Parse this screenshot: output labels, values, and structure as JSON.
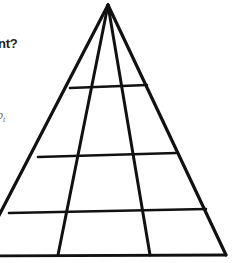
{
  "figure": {
    "type": "pyramid-grid-diagram",
    "background_color": "#ffffff",
    "stroke_color": "#000000",
    "apex": {
      "x": 108,
      "y": 5
    },
    "base": {
      "left_x": -22,
      "right_x": 226,
      "y": 255
    }
  },
  "annotations": {
    "question_fragment": "nt?",
    "question_fragment_color": "#231f20",
    "label_fragment_base": "up",
    "label_fragment_subscript": "t",
    "label_fragment_color": "#6e6e6e"
  },
  "structure": {
    "converging_lines_count": 4,
    "horizontal_dividers_count": 4,
    "rows": 4,
    "columns": 3,
    "divider_y_positions": [
      87,
      155,
      211,
      255
    ],
    "interior_diagonal_base_x": [
      58,
      150
    ]
  }
}
